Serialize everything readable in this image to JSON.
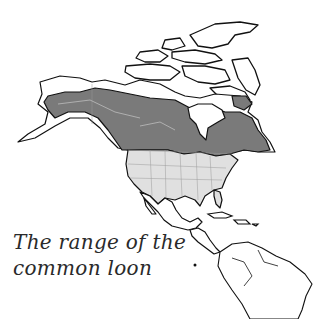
{
  "caption": {
    "line1": "The range of the",
    "line2": "common loon"
  },
  "map": {
    "subject": "Range of the common loon in North America",
    "legend_colors": {
      "breeding_range": "#7a7a7a",
      "wintering_range": "#e0e0e0",
      "outline": "#111111",
      "water": "#ffffff"
    },
    "regions": [
      "Arctic Archipelago",
      "Alaska",
      "Canada",
      "Hudson Bay",
      "United States",
      "Mexico",
      "Caribbean",
      "Central America",
      "South America"
    ]
  }
}
